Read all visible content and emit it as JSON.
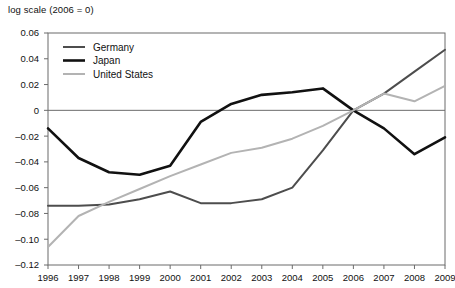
{
  "chart_data": {
    "type": "line",
    "title": "log scale (2006 = 0)",
    "xlabel": "",
    "ylabel": "",
    "grid": false,
    "legend_position": "top-left-inside",
    "x": [
      1996,
      1997,
      1998,
      1999,
      2000,
      2001,
      2002,
      2003,
      2004,
      2005,
      2006,
      2007,
      2008,
      2009
    ],
    "categories": [
      "1996",
      "1997",
      "1998",
      "1999",
      "2000",
      "2001",
      "2002",
      "2003",
      "2004",
      "2005",
      "2006",
      "2007",
      "2008",
      "2009"
    ],
    "xlim": [
      1996,
      2009
    ],
    "ylim": [
      -0.12,
      0.06
    ],
    "yticks": [
      0.06,
      0.04,
      0.02,
      0,
      -0.02,
      -0.04,
      -0.06,
      -0.08,
      -0.1,
      -0.12
    ],
    "ytick_labels": [
      "0.06",
      "0.04",
      "0.02",
      "0",
      "–0.02",
      "–0.04",
      "–0.06",
      "–0.08",
      "–0.10",
      "–0.12"
    ],
    "series": [
      {
        "name": "Germany",
        "color": "#4d4d4d",
        "width": 2.0,
        "values": [
          -0.074,
          -0.074,
          -0.073,
          -0.069,
          -0.063,
          -0.072,
          -0.072,
          -0.069,
          -0.06,
          -0.031,
          0.0,
          0.013,
          0.03,
          0.047
        ]
      },
      {
        "name": "Japan",
        "color": "#111111",
        "width": 2.6,
        "values": [
          -0.014,
          -0.037,
          -0.048,
          -0.05,
          -0.043,
          -0.009,
          0.005,
          0.012,
          0.014,
          0.017,
          0.0,
          -0.014,
          -0.034,
          -0.021
        ]
      },
      {
        "name": "United States",
        "color": "#b3b3b3",
        "width": 2.0,
        "values": [
          -0.106,
          -0.082,
          -0.071,
          -0.061,
          -0.051,
          -0.042,
          -0.033,
          -0.029,
          -0.022,
          -0.012,
          0.0,
          0.013,
          0.007,
          0.019
        ]
      }
    ]
  },
  "legend": {
    "items": [
      {
        "label": "Germany"
      },
      {
        "label": "Japan"
      },
      {
        "label": "United States"
      }
    ]
  },
  "colors": {
    "germany": "#4d4d4d",
    "japan": "#111111",
    "united_states": "#b3b3b3",
    "frame": "#6b6b6b",
    "background": "#ffffff"
  }
}
